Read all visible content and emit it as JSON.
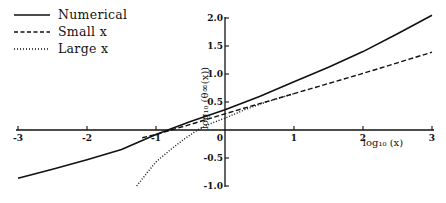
{
  "chart_data": {
    "type": "line",
    "title": "",
    "xlabel": "log10 (x)",
    "ylabel": "log10 (θ∞(x))",
    "xlim": [
      -3,
      3
    ],
    "ylim": [
      -1.0,
      2.0
    ],
    "grid": false,
    "legend_position": "top-left",
    "x_ticks": [
      "-3",
      "-2",
      "-1",
      "0",
      "1",
      "2",
      "3"
    ],
    "y_ticks": [
      "2.0",
      "1.5",
      "1.0",
      "0.5",
      "-0.5",
      "-1.0"
    ],
    "legend": [
      "Numerical",
      "Small x",
      "Large x"
    ],
    "series": [
      {
        "name": "Numerical",
        "style": "solid",
        "x": [
          -3,
          -2.5,
          -2,
          -1.5,
          -1,
          -0.5,
          0,
          0.5,
          1,
          1.5,
          2,
          2.5,
          3
        ],
        "y": [
          -0.86,
          -0.7,
          -0.53,
          -0.35,
          -0.08,
          0.15,
          0.36,
          0.6,
          0.86,
          1.12,
          1.4,
          1.72,
          2.05
        ]
      },
      {
        "name": "Small x",
        "style": "dashed",
        "x": [
          -1.2,
          -1,
          -0.5,
          0,
          0.5,
          1,
          1.5,
          2,
          2.5,
          3
        ],
        "y": [
          -0.14,
          -0.08,
          0.1,
          0.29,
          0.47,
          0.65,
          0.83,
          1.01,
          1.2,
          1.39
        ]
      },
      {
        "name": "Large x",
        "style": "dotted",
        "x": [
          -1.28,
          -1.1,
          -1,
          -0.8,
          -0.6,
          -0.4,
          -0.2,
          0,
          0.3,
          0.6,
          1
        ],
        "y": [
          -1.0,
          -0.72,
          -0.57,
          -0.36,
          -0.17,
          0.0,
          0.12,
          0.21,
          0.37,
          0.5,
          0.65
        ]
      }
    ]
  },
  "legend": {
    "items": [
      {
        "label": "Numerical",
        "style": "solid"
      },
      {
        "label": "Small x",
        "style": "dashed"
      },
      {
        "label": "Large x",
        "style": "dotted"
      }
    ]
  },
  "axes": {
    "x_label": "log₁₀ (x)",
    "y_label": "log₁₀ (θ∞(x))"
  }
}
